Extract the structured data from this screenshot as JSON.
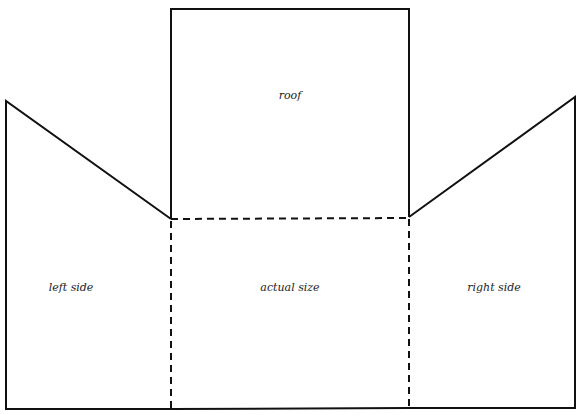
{
  "diagram": {
    "type": "papercraft-net",
    "stroke_color": "#111111",
    "labels": {
      "roof": "roof",
      "left_side": "left side",
      "actual_size": "actual size",
      "right_side": "right side"
    }
  }
}
